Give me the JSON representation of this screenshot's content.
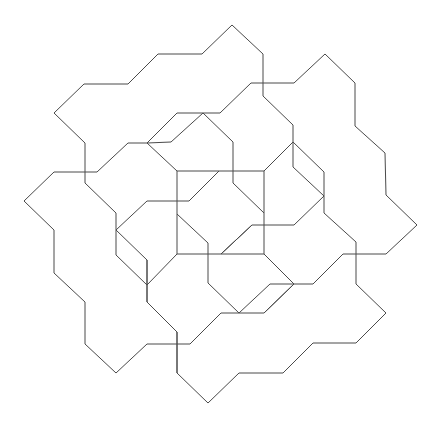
{
  "diagram": {
    "type": "line-tiling",
    "background": "#ffffff",
    "stroke_color": "#4a4a4a",
    "stroke_width": 1,
    "central_square": [
      [
        177,
        171
      ],
      [
        264,
        171
      ],
      [
        264,
        254
      ],
      [
        177,
        254
      ]
    ],
    "polylines": [
      [
        [
          85,
          143
        ],
        [
          54,
          113
        ],
        [
          84,
          84
        ],
        [
          128,
          84
        ],
        [
          158,
          54
        ],
        [
          202,
          54
        ],
        [
          232,
          25
        ],
        [
          263,
          54
        ],
        [
          263,
          96
        ],
        [
          293,
          125
        ],
        [
          293,
          167
        ],
        [
          324,
          196
        ],
        [
          294,
          225
        ],
        [
          252,
          225
        ],
        [
          221,
          254
        ]
      ],
      [
        [
          220,
          113
        ],
        [
          251,
          83
        ],
        [
          294,
          83
        ],
        [
          325,
          54
        ],
        [
          355,
          83
        ],
        [
          355,
          126
        ],
        [
          385,
          153
        ],
        [
          386,
          195
        ],
        [
          417,
          225
        ],
        [
          386,
          254
        ],
        [
          343,
          254
        ],
        [
          313,
          284
        ],
        [
          294,
          284
        ],
        [
          264,
          313
        ],
        [
          239,
          313
        ]
      ],
      [
        [
          293,
          142
        ],
        [
          264,
          171
        ]
      ],
      [
        [
          293,
          142
        ],
        [
          324,
          172
        ],
        [
          324,
          213
        ],
        [
          356,
          242
        ],
        [
          356,
          284
        ],
        [
          386,
          313
        ],
        [
          356,
          343
        ],
        [
          313,
          343
        ],
        [
          283,
          373
        ],
        [
          239,
          373
        ],
        [
          208,
          403
        ],
        [
          177,
          373
        ],
        [
          177,
          332
        ],
        [
          147,
          302
        ],
        [
          147,
          260
        ]
      ],
      [
        [
          147,
          143
        ],
        [
          177,
          113
        ],
        [
          220,
          113
        ]
      ],
      [
        [
          147,
          143
        ],
        [
          171,
          142
        ],
        [
          203,
          113
        ],
        [
          233,
          142
        ],
        [
          233,
          183
        ],
        [
          264,
          213
        ]
      ],
      [
        [
          97,
          172
        ],
        [
          128,
          143
        ],
        [
          147,
          143
        ],
        [
          177,
          171
        ]
      ],
      [
        [
          54,
          172
        ],
        [
          97,
          172
        ]
      ],
      [
        [
          54,
          172
        ],
        [
          24,
          201
        ],
        [
          54,
          230
        ],
        [
          54,
          273
        ],
        [
          85,
          302
        ],
        [
          85,
          344
        ],
        [
          116,
          373
        ],
        [
          147,
          344
        ],
        [
          190,
          344
        ],
        [
          221,
          313
        ],
        [
          239,
          313
        ]
      ],
      [
        [
          85,
          143
        ],
        [
          85,
          183
        ],
        [
          116,
          213
        ],
        [
          116,
          255
        ],
        [
          147,
          285
        ],
        [
          177,
          254
        ]
      ],
      [
        [
          116,
          230
        ],
        [
          147,
          201
        ],
        [
          189,
          201
        ],
        [
          219,
          171
        ]
      ],
      [
        [
          116,
          230
        ],
        [
          147,
          260
        ],
        [
          147,
          302
        ]
      ],
      [
        [
          177,
          214
        ],
        [
          208,
          243
        ],
        [
          208,
          283
        ],
        [
          239,
          313
        ]
      ],
      [
        [
          221,
          254
        ],
        [
          252,
          225
        ]
      ],
      [
        [
          177,
          332
        ],
        [
          177,
          373
        ]
      ],
      [
        [
          264,
          254
        ],
        [
          294,
          284
        ]
      ],
      [
        [
          270,
          284
        ],
        [
          239,
          313
        ]
      ],
      [
        [
          270,
          284
        ],
        [
          294,
          284
        ]
      ],
      [
        [
          264,
          313
        ],
        [
          294,
          284
        ]
      ]
    ]
  }
}
